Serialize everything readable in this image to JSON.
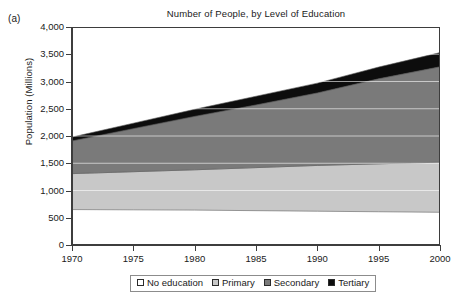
{
  "figure": {
    "panel_label": "(a)",
    "title": "Number of People, by Level of Education"
  },
  "chart_data": {
    "type": "area",
    "stacked": true,
    "title": "Number of People, by Level of Education",
    "subtitle": "",
    "xlabel": "",
    "ylabel": "Population (Millions)",
    "x": [
      1970,
      1975,
      1980,
      1985,
      1990,
      1995,
      2000
    ],
    "xlim": [
      1970,
      2000
    ],
    "ylim": [
      0,
      4000
    ],
    "xticks": [
      "1970",
      "1975",
      "1980",
      "1985",
      "1990",
      "1995",
      "2000"
    ],
    "yticks": [
      "0",
      "500",
      "1,000",
      "1,500",
      "2,000",
      "2,500",
      "3,000",
      "3,500",
      "4,000"
    ],
    "ytick_values": [
      0,
      500,
      1000,
      1500,
      2000,
      2500,
      3000,
      3500,
      4000
    ],
    "grid": "horizontal-white",
    "legend_position": "below-axis",
    "series": [
      {
        "name": "No education",
        "color": "#ffffff",
        "values": [
          650,
          645,
          640,
          630,
          620,
          610,
          600
        ]
      },
      {
        "name": "Primary",
        "color": "#c8c8c8",
        "values": [
          660,
          700,
          740,
          790,
          840,
          880,
          920
        ]
      },
      {
        "name": "Secondary",
        "color": "#7a7a7a",
        "values": [
          600,
          790,
          980,
          1150,
          1330,
          1560,
          1750
        ]
      },
      {
        "name": "Tertiary",
        "color": "#0d0d0d",
        "values": [
          70,
          100,
          130,
          160,
          180,
          215,
          260
        ]
      }
    ],
    "cumulative_tops": {
      "No education": [
        650,
        645,
        640,
        630,
        620,
        610,
        600
      ],
      "Primary": [
        1310,
        1345,
        1380,
        1420,
        1460,
        1490,
        1520
      ],
      "Secondary": [
        1910,
        2135,
        2360,
        2570,
        2790,
        3050,
        3270
      ],
      "Tertiary": [
        1980,
        2235,
        2490,
        2730,
        2970,
        3265,
        3530
      ]
    }
  },
  "legend": {
    "items": [
      {
        "label": "No education",
        "swatch": "white-swatch"
      },
      {
        "label": "Primary",
        "swatch": "light-gray-swatch"
      },
      {
        "label": "Secondary",
        "swatch": "dark-gray-swatch"
      },
      {
        "label": "Tertiary",
        "swatch": "black-swatch"
      }
    ]
  },
  "colors": {
    "no_education": "#ffffff",
    "primary": "#c8c8c8",
    "secondary": "#7a7a7a",
    "tertiary": "#0d0d0d",
    "axis": "#3d3d3d",
    "gridline": "#ffffff",
    "text": "#1a1a1a"
  }
}
